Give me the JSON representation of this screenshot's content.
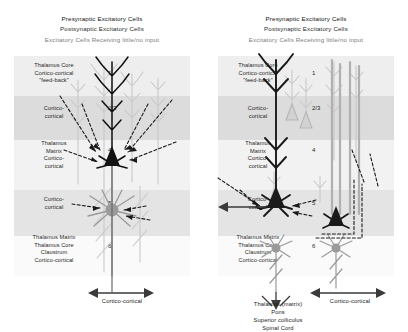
{
  "figure": {
    "colors": {
      "presynaptic": "#111111",
      "postsynaptic": "#2b2b2b",
      "little_no_input": "#7d7d7d",
      "band_light": "#f2f2f2",
      "band_mid": "#e4e4e4",
      "band_dark": "#dcdcdc"
    }
  },
  "legend": {
    "line1": "Presynaptic Excitatory Cells",
    "line2": "Postsynaptic Excitatory Cells",
    "line3": "Excitatory Cells Receiving little/no input"
  },
  "layers": [
    {
      "num": "1",
      "lines": [
        "Thalamus Core",
        "Cortico-cortical",
        "\"feed-back\""
      ]
    },
    {
      "num": "2/3",
      "lines": [
        "Cortico-",
        "cortical"
      ]
    },
    {
      "num": "4",
      "lines": [
        "Thalamus",
        "Matrix",
        "Cortico-",
        "cortical"
      ]
    },
    {
      "num": "5",
      "lines": [
        "Cortico-",
        "cortical"
      ]
    },
    {
      "num": "6",
      "lines": [
        "Thalamus Matrix",
        "Thalamus Core",
        "Claustrum",
        "Cortico-cortical"
      ]
    }
  ],
  "left_panel": {
    "output_caption": "Cortico-cortical"
  },
  "right_panel": {
    "output_caption": "Cortico-cortical",
    "subcortical_targets": [
      "Thalamus (matrix)",
      "Pons",
      "Superior colliculus",
      "Spinal Cord"
    ]
  }
}
